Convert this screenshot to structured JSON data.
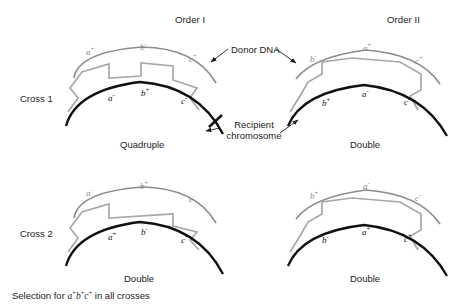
{
  "headers": [
    {
      "label": "Order I",
      "x": 175,
      "y": 14
    },
    {
      "label": "Order II",
      "x": 387,
      "y": 14
    }
  ],
  "row_labels": [
    {
      "label": "Cross 1",
      "x": 20,
      "y": 93
    },
    {
      "label": "Cross 2",
      "x": 20,
      "y": 228
    }
  ],
  "annotations": {
    "donor_dna": {
      "label": "Donor DNA",
      "x": 231,
      "y": 50
    },
    "recipient_chromosome": {
      "line1": "Recipient",
      "line2": "chromosome",
      "x": 240,
      "y": 122
    }
  },
  "caption": {
    "prefix": "Selection for ",
    "genotype_a": "a",
    "genotype_a_sup": "+",
    "genotype_b": "b",
    "genotype_b_sup": "+",
    "genotype_c": "c",
    "genotype_c_sup": "+",
    "suffix": " in all crosses",
    "x": 12,
    "y": 290
  },
  "panels": [
    {
      "id": "cross1-order1",
      "outcome": "Quadruple",
      "outcome_x": 120,
      "outcome_y": 139,
      "crossover_notches": 2,
      "donor_alleles": [
        {
          "letter": "a",
          "sign": "+",
          "x": 86,
          "y": 48
        },
        {
          "letter": "b",
          "sign": "-",
          "x": 140,
          "y": 43
        },
        {
          "letter": "c",
          "sign": "+",
          "x": 189,
          "y": 55
        }
      ],
      "recipient_alleles": [
        {
          "letter": "a",
          "sign": "-",
          "x": 108,
          "y": 94
        },
        {
          "letter": "b",
          "sign": "+",
          "x": 141,
          "y": 89
        },
        {
          "letter": "c",
          "sign": "-",
          "x": 181,
          "y": 97
        }
      ]
    },
    {
      "id": "cross1-order2",
      "outcome": "Double",
      "outcome_x": 350,
      "outcome_y": 139,
      "crossover_notches": 1,
      "donor_alleles": [
        {
          "letter": "b",
          "sign": "-",
          "x": 310,
          "y": 55
        },
        {
          "letter": "a",
          "sign": "+",
          "x": 363,
          "y": 44
        },
        {
          "letter": "c",
          "sign": "+",
          "x": 415,
          "y": 57
        }
      ],
      "recipient_alleles": [
        {
          "letter": "b",
          "sign": "+",
          "x": 322,
          "y": 99
        },
        {
          "letter": "a",
          "sign": "-",
          "x": 362,
          "y": 90
        },
        {
          "letter": "c",
          "sign": "-",
          "x": 404,
          "y": 98
        }
      ]
    },
    {
      "id": "cross2-order1",
      "outcome": "Double",
      "outcome_x": 124,
      "outcome_y": 273,
      "crossover_notches": 1,
      "donor_alleles": [
        {
          "letter": "a",
          "sign": "-",
          "x": 86,
          "y": 189
        },
        {
          "letter": "b",
          "sign": "+",
          "x": 140,
          "y": 182
        },
        {
          "letter": "c",
          "sign": "-",
          "x": 189,
          "y": 195
        }
      ],
      "recipient_alleles": [
        {
          "letter": "a",
          "sign": "+",
          "x": 108,
          "y": 233
        },
        {
          "letter": "b",
          "sign": "-",
          "x": 141,
          "y": 228
        },
        {
          "letter": "c",
          "sign": "+",
          "x": 181,
          "y": 236
        }
      ]
    },
    {
      "id": "cross2-order2",
      "outcome": "Double",
      "outcome_x": 350,
      "outcome_y": 273,
      "crossover_notches": 1,
      "donor_alleles": [
        {
          "letter": "b",
          "sign": "+",
          "x": 310,
          "y": 192
        },
        {
          "letter": "a",
          "sign": "-",
          "x": 363,
          "y": 182
        },
        {
          "letter": "c",
          "sign": "-",
          "x": 415,
          "y": 194
        }
      ],
      "recipient_alleles": [
        {
          "letter": "b",
          "sign": "-",
          "x": 322,
          "y": 236
        },
        {
          "letter": "a",
          "sign": "+",
          "x": 362,
          "y": 228
        },
        {
          "letter": "c",
          "sign": "+",
          "x": 404,
          "y": 235
        }
      ]
    }
  ],
  "colors": {
    "donor_strand": "#8c8c8c",
    "crossover_strand": "#a8a8a8",
    "recipient_strand": "#111111",
    "text": "#1d1d1d"
  }
}
